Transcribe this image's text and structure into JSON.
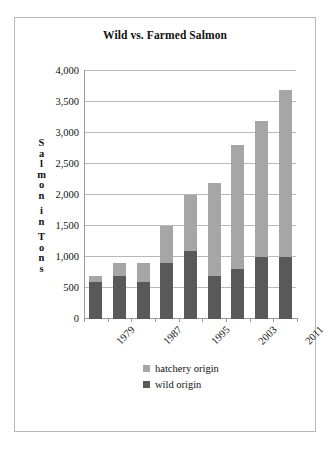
{
  "chart_data": {
    "type": "bar",
    "subtype": "stacked-bar",
    "title": "Wild vs. Farmed Salmon",
    "xlabel": "",
    "ylabel": "Salmon in Tons",
    "categories": [
      "1979",
      "1983",
      "1987",
      "1991",
      "1995",
      "1999",
      "2003",
      "2007",
      "2011"
    ],
    "visible_tick_labels": [
      "1979",
      "1987",
      "1995",
      "2003",
      "2011"
    ],
    "tick_label_rotation_deg": -45,
    "series": [
      {
        "name": "wild origin",
        "color": "#595959",
        "values": [
          600,
          700,
          600,
          900,
          1100,
          700,
          800,
          1000,
          1000
        ]
      },
      {
        "name": "hatchery origin",
        "color": "#a6a6a6",
        "values": [
          100,
          200,
          300,
          600,
          900,
          1500,
          2000,
          2200,
          2700
        ]
      }
    ],
    "totals": [
      700,
      900,
      900,
      1500,
      2000,
      2200,
      2800,
      3200,
      3700
    ],
    "ylim": [
      0,
      4000
    ],
    "ytick_values": [
      0,
      500,
      1000,
      1500,
      2000,
      2500,
      3000,
      3500,
      4000
    ],
    "ytick_labels": [
      "0",
      "500",
      "1,000",
      "1,500",
      "2,000",
      "2,500",
      "3,000",
      "3,500",
      "4,000"
    ],
    "grid": true,
    "grid_axis": "y",
    "legend_position": "bottom",
    "legend": [
      {
        "label": "hatchery origin",
        "color": "#a6a6a6"
      },
      {
        "label": "wild origin",
        "color": "#595959"
      }
    ]
  },
  "colors": {
    "hatchery": "#a6a6a6",
    "wild": "#595959",
    "gridline": "#b9b9b9",
    "axis": "#9a9a9a",
    "frame_border": "#b8b8b8",
    "text": "#111111",
    "background": "#ffffff"
  },
  "axis_title_letters": [
    "S",
    "a",
    "l",
    "m",
    "o",
    "n",
    "",
    "i",
    "n",
    "",
    "T",
    "o",
    "n",
    "s"
  ]
}
